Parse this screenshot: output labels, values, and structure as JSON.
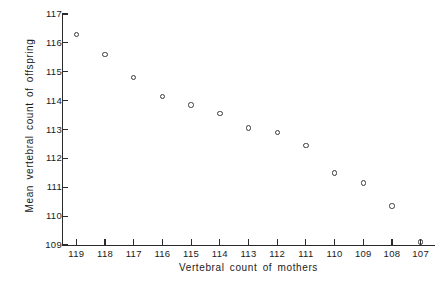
{
  "chart_data": {
    "type": "scatter",
    "title": "",
    "xlabel": "Vertebral count of mothers",
    "ylabel": "Mean vertebral count of offspring",
    "x": [
      119,
      118,
      117,
      116,
      115,
      114,
      113,
      112,
      111,
      110,
      109,
      108,
      107
    ],
    "values": [
      116.3,
      115.6,
      114.8,
      114.15,
      113.85,
      113.55,
      113.05,
      112.9,
      112.45,
      111.5,
      111.15,
      110.35,
      109.1
    ],
    "xticklabels": [
      "119",
      "118",
      "117",
      "116",
      "115",
      "114",
      "113",
      "112",
      "111",
      "110",
      "109",
      "108",
      "107"
    ],
    "yticklabels": [
      "117",
      "116",
      "115",
      "114",
      "113",
      "112",
      "111",
      "110",
      "109"
    ],
    "yticks": [
      117,
      116,
      115,
      114,
      113,
      112,
      111,
      110,
      109
    ],
    "xlim": [
      119.5,
      106.5
    ],
    "ylim": [
      109,
      117
    ],
    "x_axis_reversed": true,
    "grid": false,
    "legend": false,
    "marker": "open-circle",
    "marker_color": "#3a3a3a",
    "axis_color": "#2a2a2a",
    "background": "#ffffff"
  }
}
